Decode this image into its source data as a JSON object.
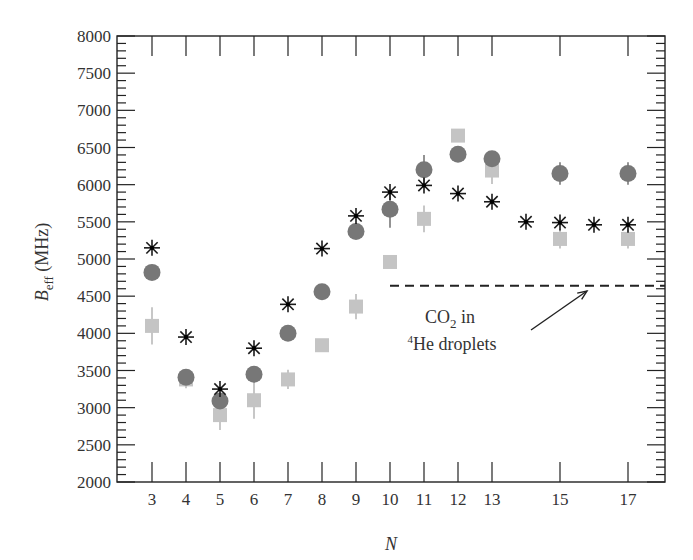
{
  "chart_data": {
    "type": "scatter",
    "title": "",
    "xlabel": "N",
    "ylabel": "B_eff (MHz)",
    "ylabel_main": "B",
    "ylabel_sub": "eff",
    "ylabel_unit": " (MHz)",
    "xlim": [
      2,
      18
    ],
    "ylim": [
      2000,
      8000
    ],
    "x_ticks": [
      3,
      4,
      5,
      6,
      7,
      8,
      9,
      10,
      11,
      12,
      13,
      15,
      17
    ],
    "x_tick_marks": [
      3,
      4,
      5,
      6,
      7,
      8,
      9,
      10,
      11,
      12,
      13,
      15,
      17
    ],
    "y_ticks": [
      2000,
      2500,
      3000,
      3500,
      4000,
      4500,
      5000,
      5500,
      6000,
      6500,
      7000,
      7500,
      8000
    ],
    "y_minor_step": 100,
    "grid": false,
    "legend": null,
    "series": [
      {
        "name": "asterisk",
        "marker": "asterisk",
        "color": "#1a1a1a",
        "x": [
          3,
          4,
          5,
          6,
          7,
          8,
          9,
          10,
          11,
          12,
          13,
          14,
          15,
          16,
          17
        ],
        "values": [
          5150,
          3950,
          3250,
          3800,
          4390,
          5140,
          5580,
          5900,
          5990,
          5880,
          5770,
          5500,
          5490,
          5460,
          5460
        ]
      },
      {
        "name": "circle",
        "marker": "circle",
        "color": "#777777",
        "x": [
          3,
          4,
          5,
          6,
          7,
          8,
          9,
          10,
          11,
          12,
          13,
          15,
          17
        ],
        "values": [
          4820,
          3410,
          3090,
          3450,
          4000,
          4560,
          5370,
          5670,
          6200,
          6410,
          6350,
          6150,
          6150
        ],
        "errors": [
          0,
          0,
          80,
          0,
          0,
          0,
          0,
          250,
          200,
          0,
          80,
          150,
          150
        ]
      },
      {
        "name": "square",
        "marker": "square",
        "color": "#c4c4c4",
        "x": [
          3,
          4,
          5,
          6,
          7,
          8,
          9,
          10,
          11,
          12,
          13,
          15,
          17
        ],
        "values": [
          4100,
          3380,
          2900,
          3100,
          3380,
          3840,
          4360,
          4960,
          5540,
          6660,
          6190,
          5270,
          5270
        ],
        "errors": [
          250,
          120,
          200,
          250,
          130,
          50,
          170,
          80,
          180,
          80,
          180,
          130,
          130
        ]
      }
    ],
    "reference_line": {
      "style": "dashed",
      "y": 4640,
      "x_start": 10,
      "x_end": 18,
      "color": "#222222"
    },
    "annotation": {
      "line1_main": "CO",
      "line1_sub": "2",
      "line1_rest": " in",
      "line2_sup": "4",
      "line2_rest": "He droplets",
      "text": "CO2 in 4He droplets",
      "arrow_from": [
        13.8,
        4140
      ],
      "arrow_to": [
        16.0,
        4590
      ]
    }
  }
}
